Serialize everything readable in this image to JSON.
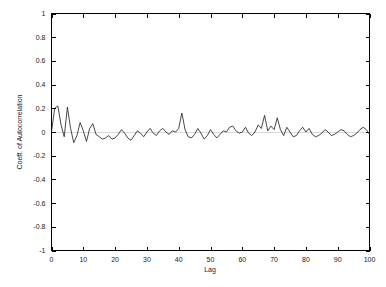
{
  "chart_data": {
    "type": "line",
    "title": "",
    "xlabel": "Lag",
    "ylabel": "Coeff. of Autocorrelation",
    "xlim": [
      0,
      100
    ],
    "ylim": [
      -1,
      1
    ],
    "grid": false,
    "legend": null,
    "line_color": "#1a1a1a",
    "background_color": "#ffffff",
    "frame_color": "#000000",
    "zero_line_color": "#d8d8d8",
    "xticks": [
      0,
      10,
      20,
      30,
      40,
      50,
      60,
      70,
      80,
      90,
      100
    ],
    "xtick_labels": [
      "0",
      "10",
      "20",
      "30",
      "40",
      "50",
      "60",
      "70",
      "80",
      "90",
      "100"
    ],
    "yticks": [
      -1,
      -0.8,
      -0.6,
      -0.4,
      -0.2,
      0,
      0.2,
      0.4,
      0.6,
      0.8,
      1
    ],
    "ytick_labels": [
      "-1",
      "-0.8",
      "-0.6",
      "-0.4",
      "-0.2",
      "0",
      "0.2",
      "0.4",
      "0.6",
      "0.8",
      "1"
    ],
    "series": [
      {
        "name": "Coeff. of Autocorrelation",
        "x": [
          0,
          1,
          2,
          3,
          4,
          5,
          6,
          7,
          8,
          9,
          10,
          11,
          12,
          13,
          14,
          15,
          16,
          17,
          18,
          19,
          20,
          21,
          22,
          23,
          24,
          25,
          26,
          27,
          28,
          29,
          30,
          31,
          32,
          33,
          34,
          35,
          36,
          37,
          38,
          39,
          40,
          41,
          42,
          43,
          44,
          45,
          46,
          47,
          48,
          49,
          50,
          51,
          52,
          53,
          54,
          55,
          56,
          57,
          58,
          59,
          60,
          61,
          62,
          63,
          64,
          65,
          66,
          67,
          68,
          69,
          70,
          71,
          72,
          73,
          74,
          75,
          76,
          77,
          78,
          79,
          80,
          81,
          82,
          83,
          84,
          85,
          86,
          87,
          88,
          89,
          90,
          91,
          92,
          93,
          94,
          95,
          96,
          97,
          98,
          99,
          100
        ],
        "y": [
          0.0,
          0.2,
          0.22,
          0.06,
          -0.04,
          0.21,
          0.03,
          -0.09,
          -0.03,
          0.08,
          0.01,
          -0.08,
          0.03,
          0.07,
          -0.02,
          -0.04,
          -0.06,
          -0.05,
          -0.03,
          -0.06,
          -0.05,
          -0.02,
          0.02,
          -0.01,
          -0.05,
          -0.07,
          -0.03,
          0.01,
          -0.01,
          -0.04,
          0.0,
          0.03,
          -0.01,
          -0.03,
          0.01,
          0.03,
          0.0,
          -0.02,
          0.01,
          0.0,
          0.03,
          0.16,
          0.02,
          -0.04,
          -0.05,
          -0.02,
          0.03,
          -0.01,
          -0.06,
          -0.03,
          0.02,
          -0.02,
          -0.05,
          -0.02,
          0.01,
          0.0,
          0.04,
          0.05,
          0.01,
          -0.01,
          0.0,
          0.04,
          -0.01,
          -0.03,
          0.0,
          0.06,
          0.03,
          0.14,
          0.01,
          0.05,
          0.02,
          0.12,
          0.02,
          -0.03,
          0.04,
          0.0,
          -0.04,
          -0.03,
          0.01,
          0.04,
          0.0,
          0.03,
          -0.02,
          -0.04,
          -0.03,
          -0.01,
          0.02,
          0.0,
          -0.03,
          -0.02,
          0.0,
          0.02,
          0.01,
          -0.02,
          -0.04,
          -0.03,
          -0.01,
          0.02,
          0.04,
          0.02,
          -0.02
        ]
      }
    ]
  }
}
